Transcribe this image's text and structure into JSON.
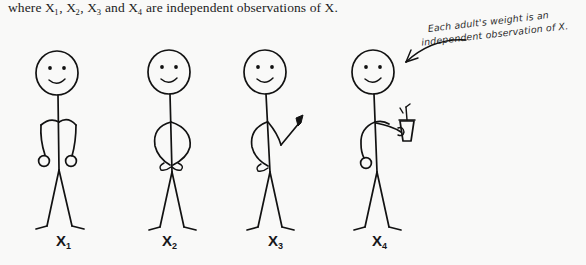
{
  "page": {
    "background_color": "#f9f9f8",
    "ink_color": "#121212",
    "width": 586,
    "height": 265
  },
  "printed_text": {
    "line": "where X1, X2, X3 and X4 are independent observations of X.",
    "prefix": "where ",
    "variable": "X",
    "subscripts": [
      "1",
      "2",
      "3",
      "4"
    ],
    "conjunction": " and ",
    "separator": ", ",
    "suffix": " are independent observations of X."
  },
  "handwritten_note": {
    "line1": "Each adult's weight is an",
    "line2": "independent observation of X.",
    "arrow": "curved-arrow-pointing-left-down",
    "points_to": "figure-4-head"
  },
  "figures": [
    {
      "id": "figure-1",
      "label": "X",
      "subscript": "1",
      "pose": "arms-hanging-down-with-round-hands",
      "props": [],
      "face": "smiling-two-dot-eyes",
      "center_x": 95,
      "label_x": 58,
      "label_y": 232
    },
    {
      "id": "figure-2",
      "label": "X",
      "subscript": "2",
      "pose": "hands-on-hips-arms-akimbo",
      "props": [],
      "face": "smiling-two-dot-eyes",
      "center_x": 177,
      "label_x": 163,
      "label_y": 232
    },
    {
      "id": "figure-3",
      "label": "X",
      "subscript": "3",
      "pose": "right-arm-raised-pointing-hand",
      "props": [],
      "face": "smiling-two-dot-eyes",
      "center_x": 272,
      "label_x": 270,
      "label_y": 232
    },
    {
      "id": "figure-4",
      "label": "X",
      "subscript": "4",
      "pose": "holding-drink-cup-in-right-hand",
      "props": [
        "cup-with-straw"
      ],
      "face": "smiling-two-dot-eyes",
      "center_x": 374,
      "label_x": 374,
      "label_y": 232
    }
  ]
}
